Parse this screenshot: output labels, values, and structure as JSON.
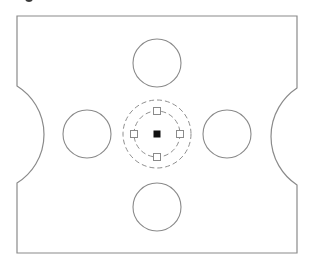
{
  "drawing": {
    "type": "cad-plate-with-holes",
    "colors": {
      "outline": "#8a8a8a",
      "dashed": "#8f8f8f",
      "grip_outline": "#8a8a8a",
      "grip_fill": "#ffffff",
      "center_grip": "#111111",
      "background": "#ffffff"
    },
    "plate": {
      "left": 17,
      "top": 16,
      "right": 297,
      "bottom": 253,
      "left_notch": {
        "y_start": 86,
        "y_end": 183,
        "apex_x": 44
      },
      "right_notch": {
        "y_start": 88,
        "y_end": 185,
        "apex_x": 271
      }
    },
    "holes": [
      {
        "name": "hole-top",
        "cx": 157,
        "cy": 63,
        "r": 24
      },
      {
        "name": "hole-left",
        "cx": 87,
        "cy": 134,
        "r": 24
      },
      {
        "name": "hole-right",
        "cx": 227,
        "cy": 134,
        "r": 24
      },
      {
        "name": "hole-bottom",
        "cx": 157,
        "cy": 207,
        "r": 24
      }
    ],
    "selected_circle": {
      "cx": 157,
      "cy": 134,
      "r_inner": 23,
      "r_outer": 34,
      "grips": [
        {
          "name": "grip-top",
          "x": 157,
          "y": 111
        },
        {
          "name": "grip-right",
          "x": 180,
          "y": 134
        },
        {
          "name": "grip-bottom",
          "x": 157,
          "y": 157
        },
        {
          "name": "grip-left",
          "x": 134,
          "y": 134
        }
      ],
      "grip_size": 7,
      "center_grip_size": 7
    }
  }
}
